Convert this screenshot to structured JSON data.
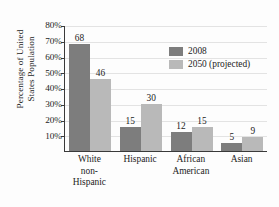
{
  "chart_data": {
    "type": "bar",
    "title": "",
    "xlabel": "",
    "ylabel": "Percentage of United States Population",
    "ylabel_lines": [
      "Percentage of United",
      "States Population"
    ],
    "categories": [
      "White non-Hispanic",
      "Hispanic",
      "African American",
      "Asian"
    ],
    "category_lines": [
      [
        "White",
        "non-",
        "Hispanic"
      ],
      [
        "Hispanic"
      ],
      [
        "African",
        "American"
      ],
      [
        "Asian"
      ]
    ],
    "series": [
      {
        "name": "2008",
        "values": [
          68,
          46,
          15,
          30
        ],
        "color": "#7d7d7d"
      },
      {
        "name": "2050 (projected)",
        "values": [
          12,
          15,
          5,
          9
        ],
        "color": "#b9b9b9"
      }
    ],
    "series_by_category": [
      {
        "category": "White non-Hispanic",
        "2008": 68,
        "2050 (projected)": 46
      },
      {
        "category": "Hispanic",
        "2008": 15,
        "2050 (projected)": 30
      },
      {
        "category": "African American",
        "2008": 12,
        "2050 (projected)": 15
      },
      {
        "category": "Asian",
        "2008": 5,
        "2050 (projected)": 9
      }
    ],
    "bar_values_flat": [
      68,
      46,
      15,
      30,
      12,
      15,
      5,
      9
    ],
    "ylim": [
      0,
      80
    ],
    "ytick_values": [
      10,
      20,
      30,
      40,
      50,
      60,
      70,
      80
    ],
    "ytick_labels": [
      "10%",
      "20%",
      "30%",
      "40%",
      "50%",
      "60%",
      "70%",
      "80%"
    ],
    "grid": true,
    "grid_axis": "y",
    "legend_position": "upper-right-inside",
    "legend": [
      {
        "label": "2008",
        "color": "#7d7d7d"
      },
      {
        "label": "2050 (projected)",
        "color": "#b9b9b9"
      }
    ],
    "value_labels_shown": true
  },
  "colors": {
    "series_2008": "#7d7d7d",
    "series_2050": "#b9b9b9",
    "axis": "#3a3a3a",
    "gridline": "#e3e3e3",
    "text": "#1c1c1c",
    "background": "#fdfdfd"
  }
}
